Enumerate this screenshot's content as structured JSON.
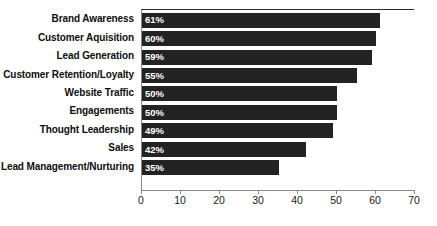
{
  "chart_data": {
    "type": "bar",
    "orientation": "horizontal",
    "title": "",
    "xlabel": "",
    "ylabel": "",
    "xlim": [
      0,
      70
    ],
    "xticks": [
      0,
      10,
      20,
      30,
      40,
      50,
      60,
      70
    ],
    "grid": false,
    "legend": false,
    "bar_color": "#232323",
    "value_label_color": "#ffffff",
    "categories": [
      "Brand Awareness",
      "Customer Aquisition",
      "Lead Generation",
      "Customer Retention/Loyalty",
      "Website Traffic",
      "Engagements",
      "Thought Leadership",
      "Sales",
      "Lead Management/Nurturing"
    ],
    "values": [
      61,
      60,
      59,
      55,
      50,
      50,
      49,
      42,
      35
    ],
    "value_labels": [
      "61%",
      "60%",
      "59%",
      "55%",
      "50%",
      "50%",
      "49%",
      "42%",
      "35%"
    ]
  }
}
